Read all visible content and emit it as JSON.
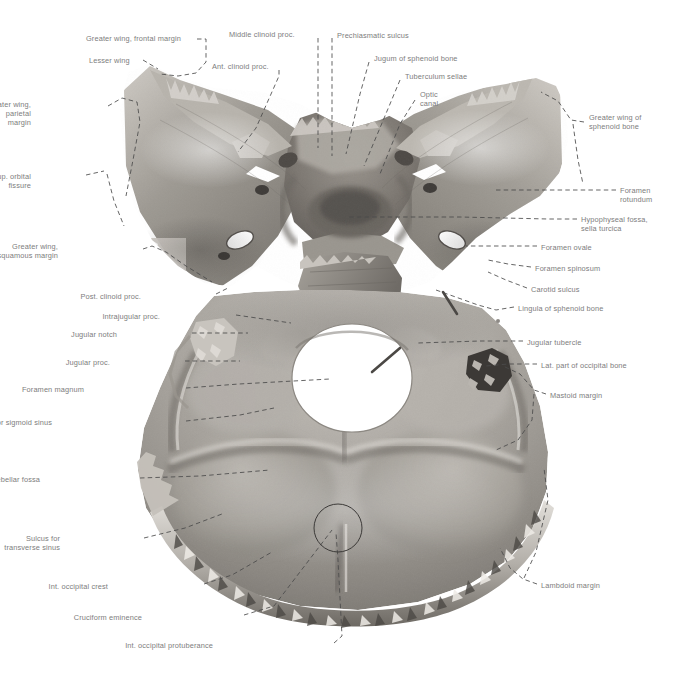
{
  "plate": {
    "width": 689,
    "height": 680,
    "background": "#ffffff",
    "label_color": "#7d7d7d",
    "leader_color": "#4a4a4a",
    "subject": "Interior of cranial base — sphenoid bone and occipital bone, superior view",
    "style": "grayscale photographic anatomical specimen with dashed leader lines"
  },
  "labels": [
    {
      "id": "greater-wing-frontal-margin",
      "text": "Greater wing, frontal margin",
      "x": 86,
      "y": 34,
      "align": "l"
    },
    {
      "id": "lesser-wing",
      "text": "Lesser wing",
      "x": 89,
      "y": 56,
      "align": "l"
    },
    {
      "id": "greater-wing-parietal-margin",
      "text": "Greater wing,\nparietal\nmargin",
      "x": 31,
      "y": 100,
      "align": "r",
      "w": 72
    },
    {
      "id": "sup-orbital-fissure",
      "text": "Sup. orbital\nfissure",
      "x": 31,
      "y": 172,
      "align": "r",
      "w": 72
    },
    {
      "id": "greater-wing-squamous-margin",
      "text": "Greater wing,\nsquamous margin",
      "x": 58,
      "y": 242,
      "align": "r",
      "w": 82
    },
    {
      "id": "post-clinoid-proc",
      "text": "Post. clinoid proc.",
      "x": 141,
      "y": 292,
      "align": "r",
      "w": 72
    },
    {
      "id": "intrajugular-proc",
      "text": "Intrajugular proc.",
      "x": 160,
      "y": 312,
      "align": "r",
      "w": 72
    },
    {
      "id": "jugular-notch",
      "text": "Jugular notch",
      "x": 117,
      "y": 330,
      "align": "r",
      "w": 72
    },
    {
      "id": "jugular-proc",
      "text": "Jugular proc.",
      "x": 110,
      "y": 358,
      "align": "r",
      "w": 72
    },
    {
      "id": "foramen-magnum",
      "text": "Foramen magnum",
      "x": 84,
      "y": 385,
      "align": "r",
      "w": 98
    },
    {
      "id": "sulcus-sigmoid-sinus",
      "text": "Sulcus for sigmoid sinus",
      "x": 52,
      "y": 418,
      "align": "r",
      "w": 130
    },
    {
      "id": "cerebellar-fossa",
      "text": "Cerebellar fossa",
      "x": 40,
      "y": 475,
      "align": "r",
      "w": 96
    },
    {
      "id": "sulcus-transverse-sinus",
      "text": "Sulcus for\ntransverse sinus",
      "x": 60,
      "y": 534,
      "align": "r",
      "w": 80
    },
    {
      "id": "int-occipital-crest",
      "text": "Int. occipital crest",
      "x": 108,
      "y": 582,
      "align": "r",
      "w": 92
    },
    {
      "id": "cruciform-eminence",
      "text": "Cruciform eminence",
      "x": 142,
      "y": 613,
      "align": "r",
      "w": 98
    },
    {
      "id": "int-occipital-protuberance",
      "text": "Int. occipital protuberance",
      "x": 213,
      "y": 641,
      "align": "r",
      "w": 117
    },
    {
      "id": "middle-clinoid-proc",
      "text": "Middle clinoid proc.",
      "x": 229,
      "y": 30,
      "align": "l"
    },
    {
      "id": "ant-clinoid-proc",
      "text": "Ant. clinoid proc.",
      "x": 212,
      "y": 62,
      "align": "l"
    },
    {
      "id": "prechiasmatic-sulcus",
      "text": "Prechiasmatic sulcus",
      "x": 337,
      "y": 31,
      "align": "l"
    },
    {
      "id": "jugum-of-sphenoid-bone",
      "text": "Jugum of sphenoid bone",
      "x": 374,
      "y": 54,
      "align": "l"
    },
    {
      "id": "tuberculum-sellae",
      "text": "Tuberculum sellae",
      "x": 405,
      "y": 72,
      "align": "l"
    },
    {
      "id": "optic-canal",
      "text": "Optic\ncanal",
      "x": 420,
      "y": 90,
      "align": "l",
      "w": 40
    },
    {
      "id": "greater-wing-of-sphenoid-bone",
      "text": "Greater wing of\nsphenoid bone",
      "x": 589,
      "y": 113,
      "align": "l",
      "w": 92
    },
    {
      "id": "foramen-rotundum",
      "text": "Foramen\nrotundum",
      "x": 620,
      "y": 186,
      "align": "l",
      "w": 64
    },
    {
      "id": "hypophyseal-fossa-sella-turcica",
      "text": "Hypophyseal fossa,\nsella turcica",
      "x": 581,
      "y": 215,
      "align": "l",
      "w": 106
    },
    {
      "id": "foramen-ovale",
      "text": "Foramen ovale",
      "x": 541,
      "y": 243,
      "align": "l",
      "w": 86
    },
    {
      "id": "foramen-spinosum",
      "text": "Foramen spinosum",
      "x": 535,
      "y": 264,
      "align": "l",
      "w": 100
    },
    {
      "id": "carotid-sulcus",
      "text": "Carotid sulcus",
      "x": 531,
      "y": 285,
      "align": "l",
      "w": 86
    },
    {
      "id": "lingula-of-sphenoid-bone",
      "text": "Lingula of sphenoid bone",
      "x": 518,
      "y": 304,
      "align": "l",
      "w": 120
    },
    {
      "id": "jugular-tubercle",
      "text": "Jugular tubercle",
      "x": 527,
      "y": 338,
      "align": "l",
      "w": 92
    },
    {
      "id": "lat-part-of-occipital-bone",
      "text": "Lat. part of occipital bone",
      "x": 541,
      "y": 361,
      "align": "l",
      "w": 124
    },
    {
      "id": "mastoid-margin",
      "text": "Mastoid margin",
      "x": 550,
      "y": 391,
      "align": "l",
      "w": 92
    },
    {
      "id": "lambdoid-margin",
      "text": "Lambdoid margin",
      "x": 541,
      "y": 581,
      "align": "l",
      "w": 98
    }
  ],
  "leaders": [
    {
      "id": "leader-greater-wing-frontal-margin",
      "d": "M 197 39 L 206 39 L 206 62 L 196 73 L 178 76 L 160 74"
    },
    {
      "id": "leader-lesser-wing",
      "d": "M 143 60 L 158 69"
    },
    {
      "id": "leader-greater-wing-parietal-margin",
      "d": "M 108 106 L 122 98 L 137 102 L 140 122 L 133 160 L 126 196"
    },
    {
      "id": "leader-sup-orbital-fissure",
      "d": "M 86 175 L 104 171"
    },
    {
      "id": "leader-sup-orbital-fissure-2",
      "d": "M 107 174 L 114 201 L 124 226"
    },
    {
      "id": "leader-greater-wing-squamous-margin",
      "d": "M 143 249 L 152 246 L 166 252 L 186 266 L 212 282"
    },
    {
      "id": "leader-post-clinoid-proc",
      "d": "M 216 294 L 228 288"
    },
    {
      "id": "leader-intrajugular-proc",
      "d": "M 236 315 L 291 323"
    },
    {
      "id": "leader-jugular-notch",
      "d": "M 192 333 L 248 333"
    },
    {
      "id": "leader-jugular-proc",
      "d": "M 185 361 L 240 361"
    },
    {
      "id": "leader-foramen-magnum",
      "d": "M 186 388 L 239 384 L 330 379"
    },
    {
      "id": "leader-sulcus-sigmoid-sinus",
      "d": "M 186 421 L 240 415 L 274 408"
    },
    {
      "id": "leader-cerebellar-fossa",
      "d": "M 140 478 L 200 476 L 270 470"
    },
    {
      "id": "leader-sulcus-transverse-sinus",
      "d": "M 144 538 L 185 528 L 222 514"
    },
    {
      "id": "leader-int-occipital-crest",
      "d": "M 204 584 L 232 575 L 272 552"
    },
    {
      "id": "leader-cruciform-eminence",
      "d": "M 244 615 L 274 606 L 332 530"
    },
    {
      "id": "leader-int-occipital-protuberance",
      "d": "M 334 643 L 342 636 L 338 560 L 336 533"
    },
    {
      "id": "leader-middle-clinoid-proc",
      "d": "M 318 38 L 318 148"
    },
    {
      "id": "leader-ant-clinoid-proc",
      "d": "M 279 70 L 279 76 L 256 128 L 238 152"
    },
    {
      "id": "leader-prechiasmatic-sulcus",
      "d": "M 332 38 L 332 156"
    },
    {
      "id": "leader-jugum-of-sphenoid-bone",
      "d": "M 369 62 L 360 94 L 346 154"
    },
    {
      "id": "leader-tuberculum-sellae",
      "d": "M 400 80 L 390 104 L 364 166"
    },
    {
      "id": "leader-optic-canal",
      "d": "M 415 100 L 400 124 L 380 174"
    },
    {
      "id": "leader-greater-wing-of-sphenoid",
      "d": "M 584 122 L 571 120 L 558 101 L 541 92"
    },
    {
      "id": "leader-greater-wing-of-sphenoid-2",
      "d": "M 573 124 L 578 160 L 583 184"
    },
    {
      "id": "leader-foramen-rotundum",
      "d": "M 616 190 L 566 190 L 496 190"
    },
    {
      "id": "leader-hypophyseal-fossa",
      "d": "M 577 219 L 548 219 L 460 217 L 348 217"
    },
    {
      "id": "leader-foramen-ovale",
      "d": "M 537 246 L 498 246 L 466 246"
    },
    {
      "id": "leader-foramen-spinosum",
      "d": "M 531 267 L 508 264 L 488 260"
    },
    {
      "id": "leader-carotid-sulcus",
      "d": "M 527 288 L 506 280 L 488 272"
    },
    {
      "id": "leader-lingula-of-sphenoid-bone",
      "d": "M 514 307 L 496 310 L 478 305 L 436 290"
    },
    {
      "id": "leader-jugular-tubercle",
      "d": "M 523 341 L 480 341 L 418 343"
    },
    {
      "id": "leader-lat-part-of-occipital-bone",
      "d": "M 537 364 L 508 364 L 486 366"
    },
    {
      "id": "leader-mastoid-margin",
      "d": "M 546 394 L 534 390 L 520 374 L 503 366"
    },
    {
      "id": "leader-mastoid-margin-2",
      "d": "M 534 394 L 532 420 L 518 440 L 496 450"
    },
    {
      "id": "leader-lambdoid-margin",
      "d": "M 537 584 L 523 579 L 510 568 L 500 548"
    },
    {
      "id": "leader-lambdoid-margin-2",
      "d": "M 524 578 L 536 552 L 548 500 L 544 468"
    }
  ],
  "annotations": [
    {
      "id": "cruciform-eminence-circle",
      "shape": "circle",
      "cx": 338,
      "cy": 528,
      "r": 24
    },
    {
      "id": "measurement-pin-right",
      "shape": "pin",
      "x1": 443,
      "y1": 292,
      "x2": 457,
      "y2": 314
    },
    {
      "id": "measurement-pin-left",
      "shape": "pin",
      "x1": 372,
      "y1": 372,
      "x2": 400,
      "y2": 348
    },
    {
      "id": "reference-dot-right",
      "shape": "dot",
      "cx": 498,
      "cy": 321,
      "r": 2
    }
  ]
}
